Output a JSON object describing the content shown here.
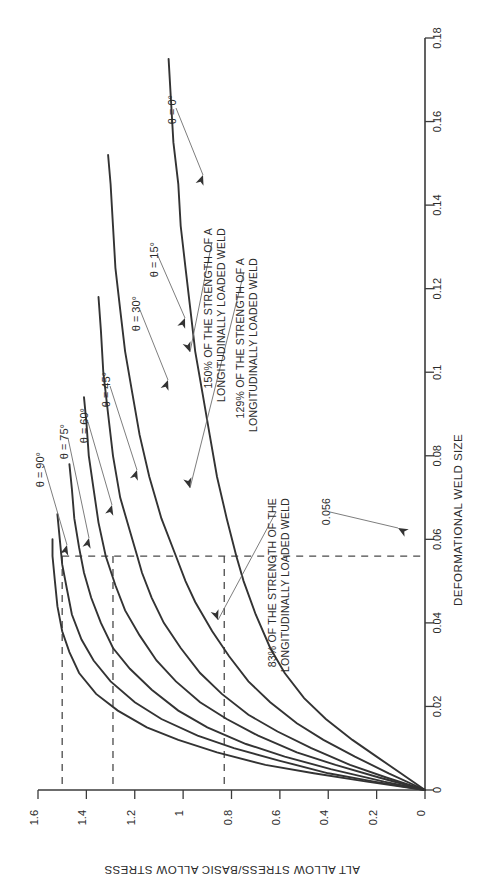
{
  "chart_data": {
    "type": "line",
    "title": "",
    "xlabel": "DEFORMATIONAL WELD SIZE",
    "ylabel": "ALT ALLOW STRESS/BASIC ALLOW STRESS",
    "xlim": [
      0,
      0.18
    ],
    "ylim": [
      0,
      1.6
    ],
    "xticks": [
      "0",
      "0.02",
      "0.04",
      "0.06",
      "0.08",
      "0.1",
      "0.12",
      "0.14",
      "0.16",
      "0.18"
    ],
    "xtick_values": [
      0,
      0.02,
      0.04,
      0.06,
      0.08,
      0.1,
      0.12,
      0.14,
      0.16,
      0.18
    ],
    "yticks": [
      "0",
      "0.2",
      "0.4",
      "0.6",
      "0.8",
      "1",
      "1.2",
      "1.4",
      "1.6"
    ],
    "ytick_values": [
      0,
      0.2,
      0.4,
      0.6,
      0.8,
      1.0,
      1.2,
      1.4,
      1.6
    ],
    "grid": false,
    "legend_position": "inline-annotations",
    "orientation": "rotated-90ccw",
    "series": [
      {
        "name": "θ = 0°",
        "theta_deg": 0,
        "points": [
          [
            0,
            0
          ],
          [
            0.004,
            0.1
          ],
          [
            0.008,
            0.2
          ],
          [
            0.012,
            0.3
          ],
          [
            0.017,
            0.41
          ],
          [
            0.022,
            0.5
          ],
          [
            0.028,
            0.58
          ],
          [
            0.034,
            0.64
          ],
          [
            0.042,
            0.7
          ],
          [
            0.05,
            0.75
          ],
          [
            0.056,
            0.78
          ],
          [
            0.065,
            0.82
          ],
          [
            0.075,
            0.86
          ],
          [
            0.085,
            0.89
          ],
          [
            0.095,
            0.92
          ],
          [
            0.105,
            0.95
          ],
          [
            0.115,
            0.97
          ],
          [
            0.125,
            0.99
          ],
          [
            0.135,
            1.01
          ],
          [
            0.145,
            1.02
          ],
          [
            0.155,
            1.04
          ],
          [
            0.165,
            1.05
          ],
          [
            0.175,
            1.06
          ]
        ]
      },
      {
        "name": "θ = 15°",
        "theta_deg": 15,
        "points": [
          [
            0,
            0
          ],
          [
            0.004,
            0.15
          ],
          [
            0.008,
            0.29
          ],
          [
            0.012,
            0.42
          ],
          [
            0.016,
            0.53
          ],
          [
            0.021,
            0.64
          ],
          [
            0.026,
            0.73
          ],
          [
            0.032,
            0.81
          ],
          [
            0.038,
            0.88
          ],
          [
            0.045,
            0.95
          ],
          [
            0.05,
            0.99
          ],
          [
            0.056,
            1.03
          ],
          [
            0.065,
            1.09
          ],
          [
            0.075,
            1.14
          ],
          [
            0.085,
            1.18
          ],
          [
            0.095,
            1.21
          ],
          [
            0.105,
            1.24
          ],
          [
            0.115,
            1.26
          ],
          [
            0.125,
            1.28
          ],
          [
            0.135,
            1.29
          ],
          [
            0.145,
            1.3
          ],
          [
            0.152,
            1.31
          ]
        ]
      },
      {
        "name": "θ = 30°",
        "theta_deg": 30,
        "points": [
          [
            0,
            0
          ],
          [
            0.003,
            0.16
          ],
          [
            0.006,
            0.31
          ],
          [
            0.01,
            0.47
          ],
          [
            0.014,
            0.61
          ],
          [
            0.018,
            0.73
          ],
          [
            0.023,
            0.84
          ],
          [
            0.028,
            0.93
          ],
          [
            0.034,
            1.01
          ],
          [
            0.04,
            1.08
          ],
          [
            0.046,
            1.13
          ],
          [
            0.052,
            1.17
          ],
          [
            0.056,
            1.19
          ],
          [
            0.062,
            1.22
          ],
          [
            0.07,
            1.26
          ],
          [
            0.08,
            1.29
          ],
          [
            0.09,
            1.31
          ],
          [
            0.1,
            1.33
          ],
          [
            0.11,
            1.34
          ],
          [
            0.118,
            1.35
          ]
        ]
      },
      {
        "name": "θ = 45°",
        "theta_deg": 45,
        "points": [
          [
            0,
            0
          ],
          [
            0.003,
            0.19
          ],
          [
            0.006,
            0.37
          ],
          [
            0.009,
            0.53
          ],
          [
            0.013,
            0.69
          ],
          [
            0.017,
            0.82
          ],
          [
            0.021,
            0.93
          ],
          [
            0.026,
            1.03
          ],
          [
            0.031,
            1.11
          ],
          [
            0.037,
            1.18
          ],
          [
            0.043,
            1.24
          ],
          [
            0.049,
            1.28
          ],
          [
            0.056,
            1.32
          ],
          [
            0.064,
            1.35
          ],
          [
            0.072,
            1.37
          ],
          [
            0.08,
            1.39
          ],
          [
            0.088,
            1.4
          ],
          [
            0.094,
            1.41
          ]
        ]
      },
      {
        "name": "θ = 60°",
        "theta_deg": 60,
        "points": [
          [
            0,
            0
          ],
          [
            0.002,
            0.17
          ],
          [
            0.005,
            0.39
          ],
          [
            0.008,
            0.58
          ],
          [
            0.011,
            0.74
          ],
          [
            0.015,
            0.9
          ],
          [
            0.019,
            1.02
          ],
          [
            0.024,
            1.13
          ],
          [
            0.029,
            1.22
          ],
          [
            0.034,
            1.29
          ],
          [
            0.04,
            1.34
          ],
          [
            0.046,
            1.38
          ],
          [
            0.052,
            1.41
          ],
          [
            0.058,
            1.43
          ],
          [
            0.065,
            1.45
          ],
          [
            0.072,
            1.46
          ],
          [
            0.078,
            1.47
          ]
        ]
      },
      {
        "name": "θ = 75°",
        "theta_deg": 75,
        "points": [
          [
            0,
            0
          ],
          [
            0.002,
            0.21
          ],
          [
            0.004,
            0.4
          ],
          [
            0.007,
            0.6
          ],
          [
            0.01,
            0.79
          ],
          [
            0.013,
            0.94
          ],
          [
            0.017,
            1.09
          ],
          [
            0.021,
            1.2
          ],
          [
            0.026,
            1.3
          ],
          [
            0.031,
            1.37
          ],
          [
            0.036,
            1.42
          ],
          [
            0.042,
            1.46
          ],
          [
            0.048,
            1.48
          ],
          [
            0.054,
            1.5
          ],
          [
            0.06,
            1.51
          ],
          [
            0.066,
            1.52
          ]
        ]
      },
      {
        "name": "θ = 90°",
        "theta_deg": 90,
        "points": [
          [
            0,
            0
          ],
          [
            0.002,
            0.24
          ],
          [
            0.004,
            0.46
          ],
          [
            0.006,
            0.66
          ],
          [
            0.009,
            0.86
          ],
          [
            0.012,
            1.02
          ],
          [
            0.015,
            1.15
          ],
          [
            0.019,
            1.27
          ],
          [
            0.023,
            1.36
          ],
          [
            0.028,
            1.43
          ],
          [
            0.033,
            1.47
          ],
          [
            0.038,
            1.5
          ],
          [
            0.044,
            1.52
          ],
          [
            0.05,
            1.53
          ],
          [
            0.056,
            1.54
          ],
          [
            0.06,
            1.54
          ]
        ]
      }
    ],
    "annotations": [
      {
        "id": "pct150",
        "text_lines": [
          "150% OF THE STRENGTH OF A",
          "LONGITUDINALLY LOADED WELD"
        ],
        "value": 1.5
      },
      {
        "id": "pct129",
        "text_lines": [
          "129% OF THE STRENGTH OF A",
          "LONGITUDINALLY LOADED WELD"
        ],
        "value": 1.29
      },
      {
        "id": "pct83",
        "text_lines": [
          "83% OF THE STRENGTH OF THE",
          "LONGITUDINALLY LOADED WELD"
        ],
        "value": 0.83
      },
      {
        "id": "weldsize",
        "text_lines": [
          "0.056"
        ],
        "value": 0.056
      }
    ],
    "reference_lines": [
      {
        "id": "ref-horizontal-150",
        "orientation": "horizontal",
        "value": 1.5
      },
      {
        "id": "ref-vertical-150",
        "orientation": "vertical",
        "value": 1.5
      },
      {
        "id": "ref-vertical-129",
        "orientation": "vertical",
        "value": 1.29
      },
      {
        "id": "ref-vertical-83",
        "orientation": "vertical",
        "value": 0.83
      },
      {
        "id": "ref-weld-size",
        "orientation": "weld-size",
        "value": 0.056
      }
    ]
  },
  "axes": {
    "x_label": "DEFORMATIONAL WELD SIZE",
    "y_label": "ALT ALLOW STRESS/BASIC ALLOW STRESS"
  },
  "angle_labels": [
    {
      "key": "a0",
      "text": "θ = 0°"
    },
    {
      "key": "a15",
      "text": "θ = 15°"
    },
    {
      "key": "a30",
      "text": "θ = 30°"
    },
    {
      "key": "a45",
      "text": "θ = 45°"
    },
    {
      "key": "a60",
      "text": "θ = 60°"
    },
    {
      "key": "a75",
      "text": "θ = 75°"
    },
    {
      "key": "a90",
      "text": "θ = 90°"
    }
  ],
  "notes": {
    "n150_l1": "150% OF THE STRENGTH OF A",
    "n150_l2": "LONGITUDINALLY LOADED WELD",
    "n129_l1": "129% OF THE STRENGTH OF A",
    "n129_l2": "LONGITUDINALLY LOADED WELD",
    "n83_l1": "83% OF THE STRENGTH OF THE",
    "n83_l2": "LONGITUDINALLY LOADED WELD",
    "weld_size": "0.056"
  },
  "colors": {
    "curve": "#333333",
    "axis": "#3b3b3b",
    "dashed": "#4a4a4a",
    "leader": "#6e6e6e",
    "text": "#2b2b2b",
    "background": "#ffffff"
  }
}
